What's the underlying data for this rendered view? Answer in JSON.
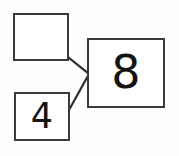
{
  "diagram": {
    "type": "part-part-whole",
    "boxes": {
      "missing_addend": {
        "label": "",
        "value": "",
        "state": "empty",
        "role": "unknown part"
      },
      "known_addend": {
        "label": "4",
        "value": "4",
        "state": "filled",
        "role": "known part"
      },
      "whole": {
        "label": "8",
        "value": "8",
        "state": "filled",
        "role": "whole"
      }
    },
    "connectors": [
      {
        "name": "top-connector",
        "from": "missing_addend",
        "to": "whole"
      },
      {
        "name": "bottom-connector",
        "from": "known_addend",
        "to": "whole"
      }
    ],
    "colors": {
      "background": "#fefefe",
      "box_fill": "#ffffff",
      "box_border": "#3b3b3b",
      "connector": "#2f2f2f",
      "digit": "#141414"
    }
  }
}
